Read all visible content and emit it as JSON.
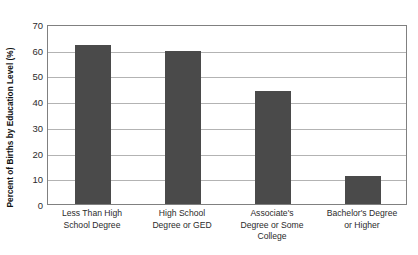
{
  "chart_data": {
    "type": "bar",
    "title": "",
    "xlabel": "",
    "ylabel": "Percent of Births by Education Level (%)",
    "ylim": [
      0,
      70
    ],
    "yticks": [
      0,
      10,
      20,
      30,
      40,
      50,
      60,
      70
    ],
    "grid": true,
    "legend": false,
    "bar_color": "#4a4a4a",
    "categories": [
      "Less Than High School Degree",
      "High School Degree or GED",
      "Associate's Degree or Some College",
      "Bachelor's Degree or Higher"
    ],
    "category_lines": [
      [
        "Less Than High",
        "School Degree"
      ],
      [
        "High School",
        "Degree or GED"
      ],
      [
        "Associate's",
        "Degree or Some",
        "College"
      ],
      [
        "Bachelor's Degree",
        "or Higher"
      ]
    ],
    "values": [
      62,
      59.5,
      44,
      11
    ]
  }
}
